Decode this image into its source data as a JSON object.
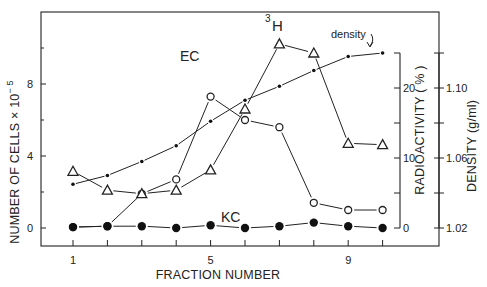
{
  "chart_data": {
    "type": "line",
    "title": "",
    "xlabel": "FRACTION NUMBER",
    "x": [
      1,
      2,
      3,
      4,
      5,
      6,
      7,
      8,
      9,
      10
    ],
    "x_tick_labels": [
      "1",
      "5",
      "9"
    ],
    "x_tick_label_values": [
      1,
      5,
      9
    ],
    "axes": {
      "left": {
        "label": "NUMBER OF CELLS × 10⁻⁵",
        "ticks": [
          0,
          4,
          8
        ],
        "range": [
          -1.0,
          12.0
        ]
      },
      "right_1": {
        "label": "RADIOACTIVITY ( % )",
        "ticks": [
          0,
          10,
          20
        ],
        "minor_ticks": [
          5,
          15,
          25
        ],
        "range": [
          0,
          25
        ]
      },
      "right_2": {
        "label": "DENSITY (g/ml)",
        "ticks": [
          "1.02",
          "1.06",
          "1.10"
        ],
        "tick_values": [
          1.02,
          1.06,
          1.1
        ],
        "minor_ticks": [
          1.04,
          1.08,
          1.12
        ],
        "range": [
          1.02,
          1.12
        ]
      }
    },
    "series": [
      {
        "name": "EC",
        "marker": "open-circle",
        "axis": "left",
        "values": [
          0.05,
          0.1,
          1.9,
          2.7,
          7.3,
          6.0,
          5.6,
          1.4,
          1.0,
          1.0
        ]
      },
      {
        "name": "KC",
        "marker": "filled-circle",
        "axis": "left",
        "values": [
          0.05,
          0.1,
          0.1,
          0.0,
          0.15,
          0.0,
          0.1,
          0.3,
          0.1,
          0.0
        ]
      },
      {
        "name": "3H",
        "marker": "open-triangle",
        "axis": "right_1",
        "values": [
          8.1,
          5.4,
          4.9,
          5.4,
          8.3,
          17.0,
          26.3,
          25.0,
          12.1,
          11.9
        ]
      },
      {
        "name": "density",
        "marker": "small-dot",
        "axis": "right_2",
        "values": [
          1.045,
          1.05,
          1.058,
          1.067,
          1.081,
          1.093,
          1.101,
          1.11,
          1.118,
          1.12
        ]
      }
    ],
    "annotations": [
      {
        "text": "EC",
        "near_fraction": 5
      },
      {
        "text": "KC",
        "near_fraction": 5.5
      },
      {
        "text": "3H",
        "near_fraction": 7
      },
      {
        "text": "density",
        "near_fraction": 10,
        "with_arrow": true
      }
    ],
    "grid": false,
    "legend": "inline labels"
  },
  "labels": {
    "xlabel": "FRACTION NUMBER",
    "ylabel_left": "NUMBER OF CELLS × 10",
    "ylabel_left_exp": "− 5",
    "ylabel_right1": "RADIOACTIVITY ( % )",
    "ylabel_right2": "DENSITY (g/ml)",
    "ec": "EC",
    "kc": "KC",
    "h3_sup": "3",
    "h3": "H",
    "density": "density"
  }
}
